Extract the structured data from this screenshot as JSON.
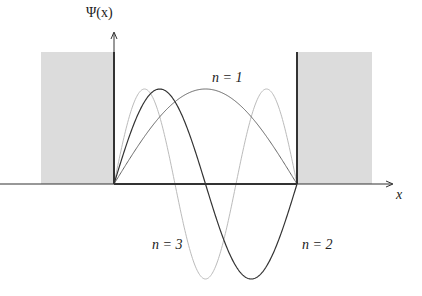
{
  "diagram": {
    "y_axis_label": "Ψ(x)",
    "x_axis_label": "x",
    "curve_labels": [
      {
        "n": 1,
        "text": "n = 1",
        "x": 212,
        "y": 70
      },
      {
        "n": 2,
        "text": "n = 2",
        "x": 302,
        "y": 237
      },
      {
        "n": 3,
        "text": "n = 3",
        "x": 152,
        "y": 237
      }
    ],
    "geometry": {
      "baseline_y": 184,
      "well_left_x": 114,
      "well_right_x": 297,
      "amplitude_px": 95,
      "wall_top_y": 52,
      "y_axis_top_y": 33,
      "x_axis_end_x": 392,
      "left_shade": {
        "x": 41,
        "y": 52,
        "w": 73,
        "h": 132
      },
      "right_shade": {
        "x": 298,
        "y": 52,
        "w": 74,
        "h": 132
      }
    },
    "colors": {
      "shade": "#dcdcdc",
      "axis": "#333333",
      "wall": "#333333",
      "n1": "#666666",
      "n2": "#333333",
      "n3": "#bbbbbb"
    }
  },
  "chart_data": {
    "type": "line",
    "title": "",
    "xlabel": "x",
    "ylabel": "Ψ(x)",
    "x_range": [
      0,
      1
    ],
    "series": [
      {
        "name": "n = 1",
        "function": "sin(pi*x)",
        "nodes": [
          0,
          1
        ],
        "extrema": [
          {
            "x": 0.5,
            "y": 1
          }
        ]
      },
      {
        "name": "n = 2",
        "function": "sin(2*pi*x)",
        "nodes": [
          0,
          0.5,
          1
        ],
        "extrema": [
          {
            "x": 0.25,
            "y": 1
          },
          {
            "x": 0.75,
            "y": -1
          }
        ]
      },
      {
        "name": "n = 3",
        "function": "sin(3*pi*x)",
        "nodes": [
          0,
          0.333,
          0.667,
          1
        ],
        "extrema": [
          {
            "x": 0.167,
            "y": 1
          },
          {
            "x": 0.5,
            "y": -1
          },
          {
            "x": 0.833,
            "y": 1
          }
        ]
      }
    ],
    "grid": false,
    "legend": "inline labels"
  }
}
